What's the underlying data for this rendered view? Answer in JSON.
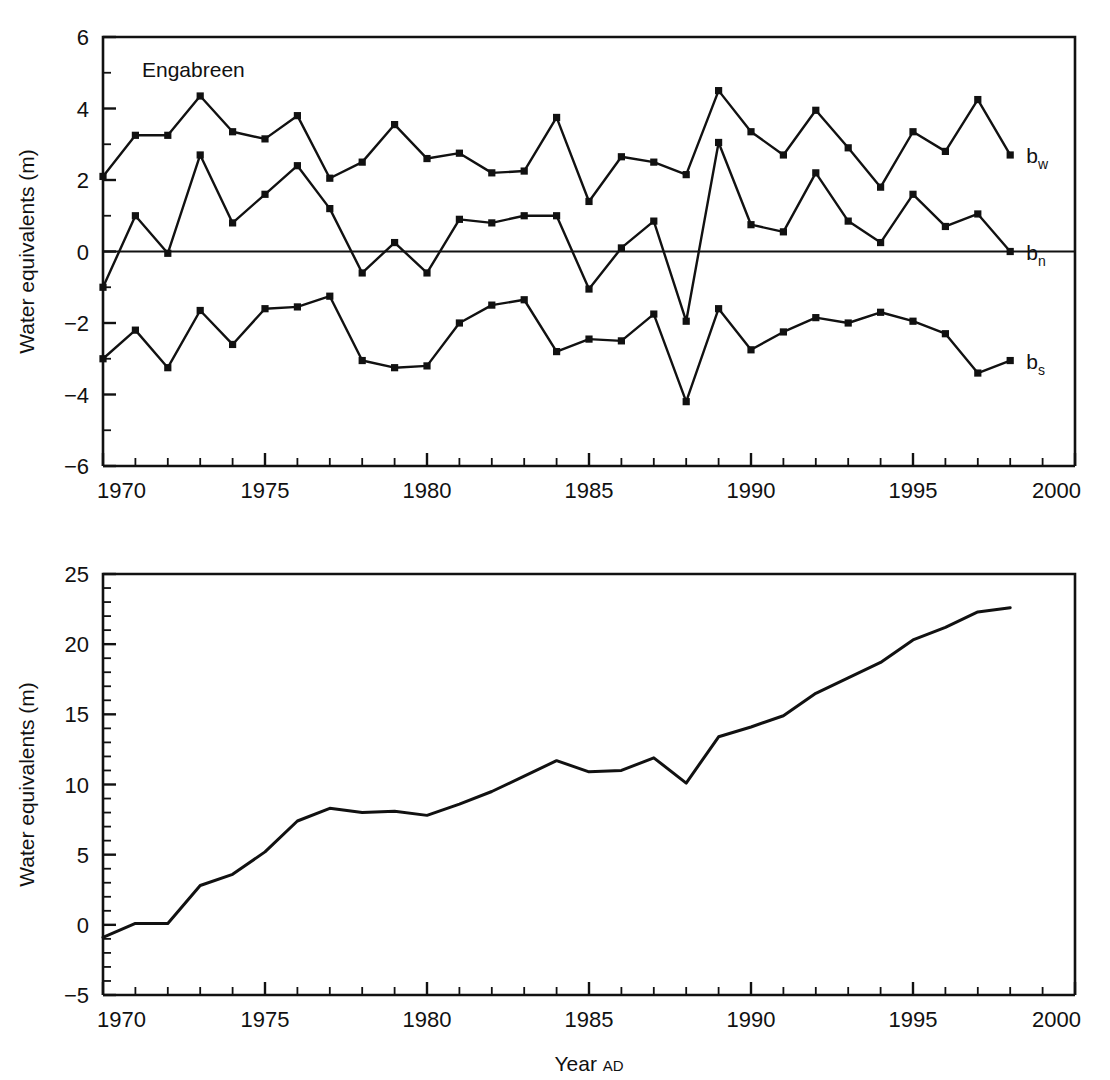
{
  "figure": {
    "background": "#ffffff",
    "line_color": "#111111",
    "marker_color": "#111111"
  },
  "top_panel": {
    "title": "Engabreen",
    "ylabel": "Water equivalents (m)",
    "series_labels": {
      "bw": {
        "base": "b",
        "sub": "w"
      },
      "bn": {
        "base": "b",
        "sub": "n"
      },
      "bs": {
        "base": "b",
        "sub": "s"
      }
    },
    "y_ticks": [
      "6",
      "4",
      "2",
      "0",
      "-2",
      "-4",
      "-6"
    ],
    "x_ticks": [
      "1970",
      "1975",
      "1980",
      "1985",
      "1990",
      "1995",
      "2000"
    ]
  },
  "bottom_panel": {
    "ylabel": "Water equivalents (m)",
    "xlabel_main": "Year",
    "xlabel_small": "AD",
    "y_ticks": [
      "25",
      "20",
      "15",
      "10",
      "5",
      "0",
      "-5"
    ],
    "x_ticks": [
      "1970",
      "1975",
      "1980",
      "1985",
      "1990",
      "1995",
      "2000"
    ]
  },
  "chart_data": [
    {
      "type": "line",
      "title": "Engabreen",
      "xlabel": "",
      "ylabel": "Water equivalents (m)",
      "xlim": [
        1970,
        2000
      ],
      "ylim": [
        -6,
        6
      ],
      "y_major_step": 2,
      "y_minor_step": 1,
      "x_major_step": 5,
      "x_minor_step": 1,
      "grid": false,
      "legend": "right-inline",
      "markers": "square",
      "zero_line": true,
      "x": [
        1970,
        1971,
        1972,
        1973,
        1974,
        1975,
        1976,
        1977,
        1978,
        1979,
        1980,
        1981,
        1982,
        1983,
        1984,
        1985,
        1986,
        1987,
        1988,
        1989,
        1990,
        1991,
        1992,
        1993,
        1994,
        1995,
        1996,
        1997,
        1998
      ],
      "series": [
        {
          "name": "b_w",
          "label": "bw",
          "description": "Winter balance",
          "values": [
            2.1,
            3.25,
            3.25,
            4.35,
            3.35,
            3.15,
            3.8,
            2.05,
            2.5,
            3.55,
            2.6,
            2.75,
            2.2,
            2.25,
            3.75,
            1.4,
            2.65,
            2.5,
            2.15,
            4.5,
            3.35,
            2.7,
            3.95,
            2.9,
            1.8,
            3.35,
            2.8,
            4.25,
            2.7
          ]
        },
        {
          "name": "b_n",
          "label": "bn",
          "description": "Net balance",
          "values": [
            -1.0,
            1.0,
            -0.05,
            2.7,
            0.8,
            1.6,
            2.4,
            1.2,
            -0.6,
            0.25,
            -0.6,
            0.9,
            0.8,
            1.0,
            1.0,
            -1.05,
            0.1,
            0.85,
            -1.95,
            3.05,
            0.75,
            0.55,
            2.2,
            0.85,
            0.25,
            1.6,
            0.7,
            1.05,
            0.0
          ]
        },
        {
          "name": "b_s",
          "label": "bs",
          "description": "Summer balance",
          "values": [
            -3.0,
            -2.2,
            -3.25,
            -1.65,
            -2.6,
            -1.6,
            -1.55,
            -1.25,
            -3.05,
            -3.25,
            -3.2,
            -2.0,
            -1.5,
            -1.35,
            -2.8,
            -2.45,
            -2.5,
            -1.75,
            -4.2,
            -1.6,
            -2.75,
            -2.25,
            -1.85,
            -2.0,
            -1.7,
            -1.95,
            -2.3,
            -3.4,
            -3.05
          ]
        }
      ]
    },
    {
      "type": "line",
      "title": "",
      "xlabel": "Year AD",
      "ylabel": "Water equivalents (m)",
      "xlim": [
        1970,
        2000
      ],
      "ylim": [
        -5,
        25
      ],
      "y_major_step": 5,
      "y_minor_step": 1,
      "x_major_step": 5,
      "x_minor_step": 1,
      "grid": false,
      "markers": "none",
      "description": "Cumulative net balance",
      "x": [
        1970,
        1971,
        1972,
        1973,
        1974,
        1975,
        1976,
        1977,
        1978,
        1979,
        1980,
        1981,
        1982,
        1983,
        1984,
        1985,
        1986,
        1987,
        1988,
        1989,
        1990,
        1991,
        1992,
        1993,
        1994,
        1995,
        1996,
        1997,
        1998
      ],
      "series": [
        {
          "name": "cumulative_bn",
          "label": "Cumulative net balance",
          "values": [
            -0.9,
            0.1,
            0.1,
            2.8,
            3.6,
            5.2,
            7.4,
            8.3,
            8.0,
            8.1,
            7.8,
            8.6,
            9.5,
            10.6,
            11.7,
            10.9,
            11.0,
            11.9,
            10.1,
            13.4,
            14.1,
            14.9,
            16.5,
            17.6,
            18.7,
            20.3,
            21.2,
            22.3,
            22.6
          ]
        }
      ]
    }
  ]
}
